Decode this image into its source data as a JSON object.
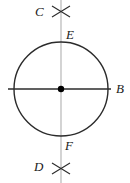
{
  "figure": {
    "canvas": {
      "width": 130,
      "height": 183,
      "background": "#ffffff"
    },
    "colors": {
      "stroke_dark": "#2b2b2b",
      "stroke_light": "#b0b0b0",
      "point_fill": "#000000",
      "label_text": "#1a1a1a"
    },
    "circle": {
      "center_x": 61,
      "center_y": 89,
      "radius": 47,
      "stroke_width": 1.4
    },
    "center_point": {
      "x": 61,
      "y": 89,
      "radius": 3.2
    },
    "horizontal_line": {
      "x1": 8,
      "y1": 89,
      "x2": 111,
      "y2": 89,
      "stroke_width": 1.4
    },
    "vertical_line": {
      "x1": 61,
      "y1": 0,
      "x2": 61,
      "y2": 183,
      "stroke_width": 1.1
    },
    "arc_marks": [
      {
        "name": "top-arc-cross",
        "cx": 61,
        "cy": 11,
        "arm": 9,
        "stroke_width": 1.1
      },
      {
        "name": "bottom-arc-cross",
        "cx": 61,
        "cy": 168,
        "arm": 9,
        "stroke_width": 1.1
      }
    ],
    "labels": [
      {
        "id": "C",
        "text": "C",
        "x": 35,
        "y": 5
      },
      {
        "id": "E",
        "text": "E",
        "x": 66,
        "y": 28
      },
      {
        "id": "B",
        "text": "B",
        "x": 116,
        "y": 82
      },
      {
        "id": "F",
        "text": "F",
        "x": 65,
        "y": 139
      },
      {
        "id": "D",
        "text": "D",
        "x": 34,
        "y": 160
      }
    ]
  }
}
